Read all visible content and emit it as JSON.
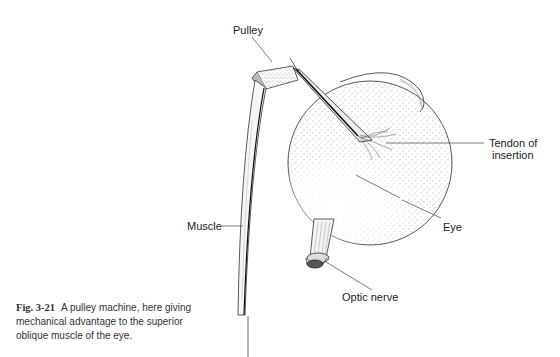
{
  "figure": {
    "number": "Fig. 3-21",
    "caption": "A pulley machine, here giving mechanical advantage to the superior oblique muscle of the eye.",
    "labels": {
      "pulley": "Pulley",
      "tendon_line1": "Tendon of",
      "tendon_line2": "insertion",
      "eye": "Eye",
      "muscle": "Muscle",
      "optic_nerve": "Optic nerve"
    }
  }
}
